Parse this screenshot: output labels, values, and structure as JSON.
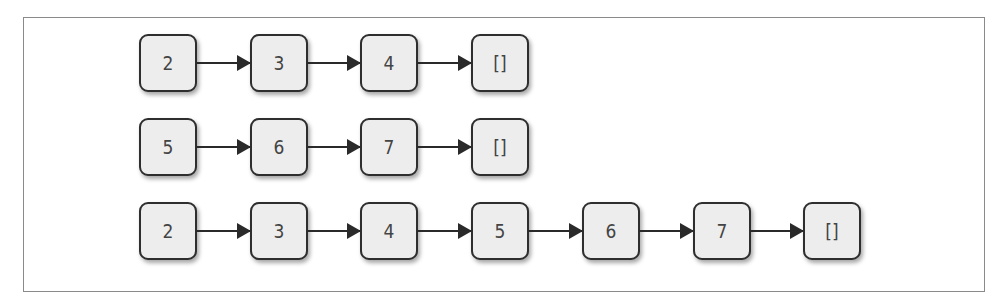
{
  "diagram": {
    "type": "linked-list-concatenation",
    "lists": [
      {
        "name": "list-a",
        "nodes": [
          "2",
          "3",
          "4",
          "[]"
        ]
      },
      {
        "name": "list-b",
        "nodes": [
          "5",
          "6",
          "7",
          "[]"
        ]
      },
      {
        "name": "list-concatenated",
        "nodes": [
          "2",
          "3",
          "4",
          "5",
          "6",
          "7",
          "[]"
        ]
      }
    ]
  }
}
